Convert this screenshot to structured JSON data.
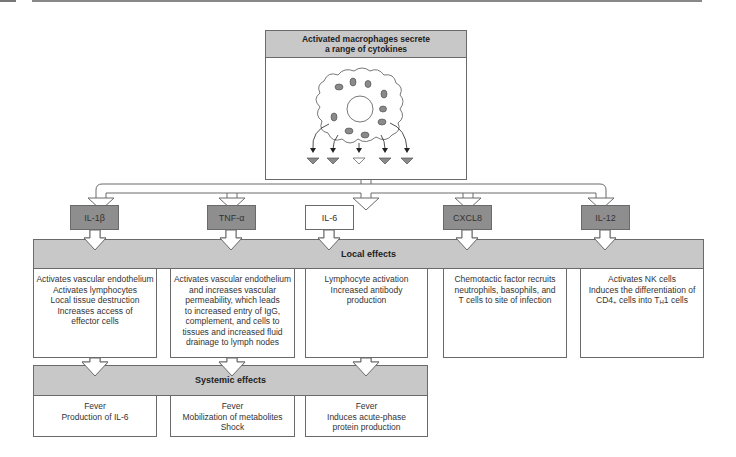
{
  "diagram": {
    "title": "Activated macrophages secrete a range of cytokines",
    "title_lines": [
      "Activated macrophages secrete",
      "a range of cytokines"
    ],
    "colors": {
      "header_gray": "#c8c8c8",
      "dark_box": "#8e8e8e",
      "border": "#6a6a6a",
      "granule": "#8a8a8a"
    },
    "cytokines": [
      {
        "label": "IL-1β",
        "style": "dark"
      },
      {
        "label": "TNF-α",
        "style": "dark"
      },
      {
        "label": "IL-6",
        "style": "light"
      },
      {
        "label": "CXCL8",
        "style": "dark"
      },
      {
        "label": "IL-12",
        "style": "dark"
      }
    ],
    "local_effects": {
      "label": "Local effects",
      "items": [
        "Activates vascular endothelium\nActivates lymphocytes\nLocal tissue destruction\nIncreases access of\neffector cells",
        "Activates vascular endothelium\nand increases vascular\npermeability, which leads\nto increased entry of IgG,\ncomplement, and cells to\ntissues and increased fluid\ndrainage to lymph nodes",
        "Lymphocyte activation\nIncreased antibody\nproduction",
        "Chemotactic factor recruits\nneutrophils, basophils, and\nT cells to site of infection",
        {
          "line1": "Activates NK cells",
          "line2": "Induces the differentiation of",
          "line3_pre": "CD4",
          "line3_sup": "+",
          "line3_mid": " cells into T",
          "line3_sub": "H",
          "line3_post": "1 cells"
        }
      ]
    },
    "systemic_effects": {
      "label": "Systemic effects",
      "items": [
        "Fever\nProduction of IL-6",
        "Fever\nMobilization of metabolites\nShock",
        "Fever\nInduces acute-phase\nprotein production"
      ]
    }
  }
}
